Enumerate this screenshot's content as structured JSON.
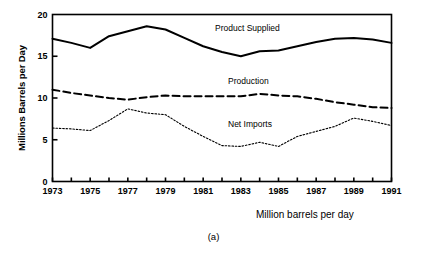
{
  "figure": {
    "caption": "(a)",
    "x_axis_title": "Million barrels per day",
    "y_axis_title": "Millions Barrels per Day"
  },
  "chart_data": {
    "type": "line",
    "title": "",
    "subtitle": "",
    "xlabel": "Million barrels per day",
    "ylabel": "Millions Barrels per Day",
    "xlim": [
      1973,
      1991
    ],
    "ylim": [
      0,
      20
    ],
    "grid": false,
    "legend_position": "inline-annotations",
    "x_tick_labels": [
      "1973",
      "1975",
      "1977",
      "1979",
      "1981",
      "1983",
      "1985",
      "1987",
      "1989",
      "1991"
    ],
    "x_tick_values": [
      1973,
      1975,
      1977,
      1979,
      1981,
      1983,
      1985,
      1987,
      1989,
      1991
    ],
    "x_minor_tick_values": [
      1974,
      1976,
      1978,
      1980,
      1982,
      1984,
      1986,
      1988,
      1990
    ],
    "y_tick_labels": [
      "0",
      "5",
      "10",
      "15",
      "20"
    ],
    "y_tick_values": [
      0,
      5,
      10,
      15,
      20
    ],
    "x": [
      1973,
      1974,
      1975,
      1976,
      1977,
      1978,
      1979,
      1980,
      1981,
      1982,
      1983,
      1984,
      1985,
      1986,
      1987,
      1988,
      1989,
      1990,
      1991
    ],
    "series": [
      {
        "name": "Product Supplied",
        "style": "solid",
        "color": "#000000",
        "values": [
          17.1,
          16.6,
          16.0,
          17.4,
          18.0,
          18.6,
          18.2,
          17.2,
          16.2,
          15.5,
          15.0,
          15.6,
          15.7,
          16.2,
          16.7,
          17.1,
          17.2,
          17.0,
          16.6
        ]
      },
      {
        "name": "Production",
        "style": "dashed",
        "color": "#000000",
        "values": [
          11.0,
          10.6,
          10.3,
          10.0,
          9.8,
          10.1,
          10.3,
          10.2,
          10.2,
          10.2,
          10.2,
          10.5,
          10.3,
          10.2,
          9.9,
          9.5,
          9.2,
          8.9,
          8.8
        ]
      },
      {
        "name": "Net Imports",
        "style": "dotted",
        "color": "#000000",
        "values": [
          6.4,
          6.3,
          6.1,
          7.3,
          8.7,
          8.2,
          8.0,
          6.6,
          5.4,
          4.3,
          4.2,
          4.7,
          4.2,
          5.4,
          6.0,
          6.6,
          7.6,
          7.2,
          6.7
        ]
      }
    ]
  }
}
